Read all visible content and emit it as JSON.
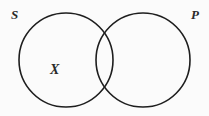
{
  "diagram": {
    "type": "venn",
    "sets": [
      {
        "id": "S",
        "label": "S",
        "cx": 66,
        "cy": 60,
        "r": 47
      },
      {
        "id": "P",
        "label": "P",
        "cx": 143,
        "cy": 60,
        "r": 47
      }
    ],
    "markers": [
      {
        "label": "X",
        "region": "S only"
      }
    ],
    "stroke_color": "#1e1e1e",
    "background": "#fbfbfb"
  }
}
